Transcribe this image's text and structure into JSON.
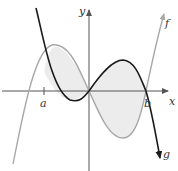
{
  "figure": {
    "axis_labels": {
      "x": "x",
      "y": "y"
    },
    "point_labels": {
      "a": "a",
      "b": "b"
    },
    "curves": [
      {
        "name": "f",
        "label": "f",
        "color": "#a8a8a8"
      },
      {
        "name": "g",
        "label": "g",
        "color": "#1a1a1a"
      }
    ],
    "shading_color": "#ececec",
    "axis_color": "#555555"
  }
}
